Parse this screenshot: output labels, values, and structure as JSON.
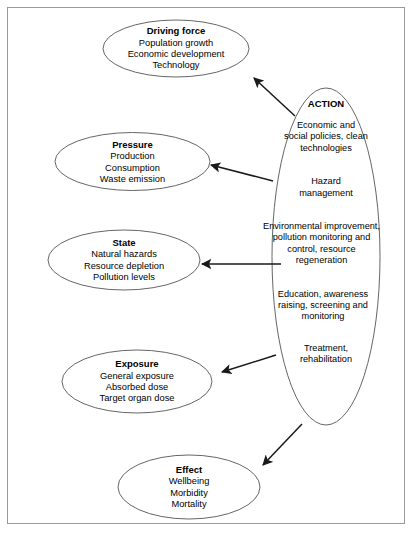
{
  "diagram": {
    "frame_color": "#9a9a9a",
    "ellipse_stroke": "#555555",
    "arrow_color": "#1a1a1a",
    "nodes": [
      {
        "id": "driving-force",
        "title": "Driving force",
        "lines": [
          "Population growth",
          "Economic development",
          "Technology"
        ]
      },
      {
        "id": "pressure",
        "title": "Pressure",
        "lines": [
          "Production",
          "Consumption",
          "Waste emission"
        ]
      },
      {
        "id": "state",
        "title": "State",
        "lines": [
          "Natural hazards",
          "Resource depletion",
          "Pollution levels"
        ]
      },
      {
        "id": "exposure",
        "title": "Exposure",
        "lines": [
          "General exposure",
          "Absorbed dose",
          "Target organ dose"
        ]
      },
      {
        "id": "effect",
        "title": "Effect",
        "lines": [
          "Wellbeing",
          "Morbidity",
          "Mortality"
        ]
      }
    ],
    "action": {
      "title": "ACTION",
      "groups": [
        [
          "Economic and",
          "social policies, clean",
          "technologies"
        ],
        [
          "Hazard",
          "management"
        ],
        [
          "Environmental improvement,",
          "pollution monitoring and",
          "control, resource",
          "regeneration"
        ],
        [
          "Education, awareness",
          "raising, screening and",
          "monitoring"
        ],
        [
          "Treatment,",
          "rehabilitation"
        ]
      ]
    },
    "arrows": [
      {
        "id": "action-to-driving-force",
        "from": [
          295,
          116
        ],
        "to": [
          253,
          77
        ]
      },
      {
        "id": "action-to-pressure",
        "from": [
          273,
          181
        ],
        "to": [
          210,
          165
        ]
      },
      {
        "id": "action-to-state",
        "from": [
          281,
          264
        ],
        "to": [
          201,
          264
        ]
      },
      {
        "id": "action-to-exposure",
        "from": [
          276,
          355
        ],
        "to": [
          221,
          373
        ]
      },
      {
        "id": "action-to-effect",
        "from": [
          302,
          424
        ],
        "to": [
          262,
          466
        ]
      }
    ]
  }
}
